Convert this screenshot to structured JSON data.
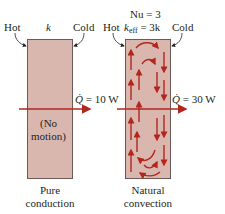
{
  "colors": {
    "box_fill": "#d9b7ae",
    "box_border": "#6b5a55",
    "arrow": "#b3261e",
    "text": "#231f20"
  },
  "left_panel": {
    "hot_label": "Hot",
    "cold_label": "Cold",
    "k_label": "k",
    "heat_rate_symbol": "Q̇",
    "heat_rate_value": "= 10 W",
    "inner_line1": "(No",
    "inner_line2": "motion)",
    "caption_line1": "Pure",
    "caption_line2": "conduction"
  },
  "right_panel": {
    "nusselt_label": "Nu = 3",
    "hot_label": "Hot",
    "cold_label": "Cold",
    "keff_k": "k",
    "keff_sub": "eff",
    "keff_rest": "= 3k",
    "heat_rate_symbol": "Q̇",
    "heat_rate_value": "= 30 W",
    "caption_line1": "Natural",
    "caption_line2": "convection"
  }
}
